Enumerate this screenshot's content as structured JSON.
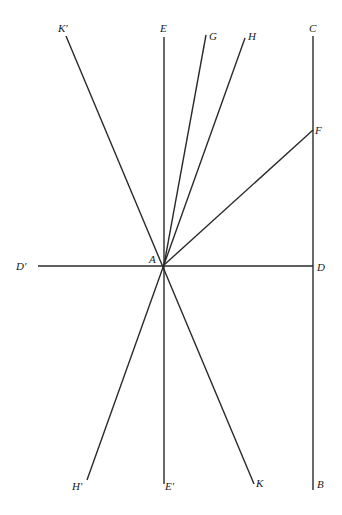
{
  "diagram": {
    "origin": {
      "label": "A",
      "x": 164,
      "y": 265
    },
    "labels": {
      "K_prime": "K′",
      "E": "E",
      "G": "G",
      "H": "H",
      "C": "C",
      "F": "F",
      "D_prime": "D′",
      "A": "A",
      "D": "D",
      "H_prime": "H′",
      "E_prime": "E′",
      "K": "K",
      "B": "B"
    },
    "lines": [
      {
        "name": "K′K",
        "from": [
          66,
          36
        ],
        "to": [
          254,
          484
        ]
      },
      {
        "name": "EE′",
        "from": [
          164,
          37
        ],
        "to": [
          164,
          484
        ]
      },
      {
        "name": "AG",
        "from": [
          164,
          265
        ],
        "to": [
          206,
          35
        ]
      },
      {
        "name": "H′H",
        "from": [
          87,
          480
        ],
        "to": [
          245,
          38
        ]
      },
      {
        "name": "AF",
        "from": [
          164,
          265
        ],
        "to": [
          313,
          130
        ]
      },
      {
        "name": "D′D",
        "from": [
          38,
          266
        ],
        "to": [
          313,
          266
        ]
      },
      {
        "name": "CB",
        "from": [
          313,
          36
        ],
        "to": [
          313,
          490
        ]
      }
    ],
    "line_color": "#2a2a2a"
  }
}
